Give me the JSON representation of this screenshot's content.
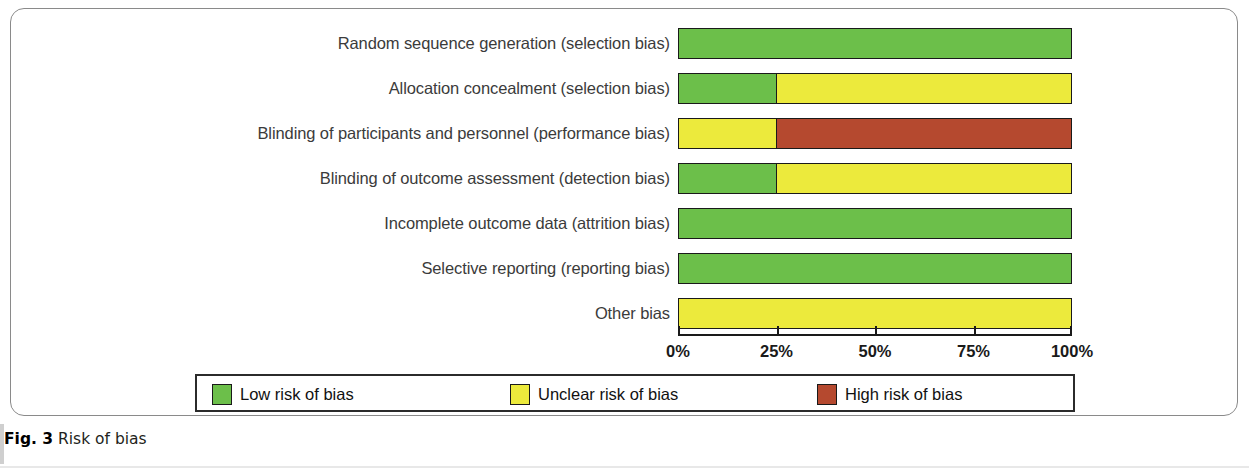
{
  "caption": {
    "prefix": "Fig. 3",
    "text": " Risk of bias"
  },
  "colors": {
    "low": "#6cbf4a",
    "unclear": "#ecea3c",
    "high": "#b5492f",
    "outline": "#1a1a1a",
    "frame": "#8a8a8a"
  },
  "legend": {
    "items": [
      {
        "label": "Low risk of bias",
        "color_key": "low",
        "left": 15
      },
      {
        "label": "Unclear risk of bias",
        "color_key": "unclear",
        "left": 313
      },
      {
        "label": "High risk of bias",
        "color_key": "high",
        "left": 620
      }
    ]
  },
  "axis": {
    "ticks": [
      {
        "label": "0%",
        "value": 0
      },
      {
        "label": "25%",
        "value": 25
      },
      {
        "label": "50%",
        "value": 50
      },
      {
        "label": "75%",
        "value": 75
      },
      {
        "label": "100%",
        "value": 100
      }
    ],
    "min": 0,
    "max": 100
  },
  "chart_data": {
    "type": "bar",
    "orientation": "horizontal",
    "stacked": true,
    "percent": true,
    "title": "Risk of bias",
    "xlabel": "",
    "ylabel": "",
    "xlim": [
      0,
      100
    ],
    "grid": false,
    "legend_position": "bottom",
    "tick_labels": [
      "0%",
      "25%",
      "50%",
      "75%",
      "100%"
    ],
    "categories": [
      "Random sequence generation (selection bias)",
      "Allocation concealment (selection bias)",
      "Blinding of participants and personnel (performance bias)",
      "Blinding of outcome assessment (detection bias)",
      "Incomplete outcome data (attrition bias)",
      "Selective reporting (reporting bias)",
      "Other bias"
    ],
    "series": [
      {
        "name": "Low risk of bias",
        "color": "#6cbf4a",
        "values": [
          100,
          25,
          0,
          25,
          100,
          100,
          0
        ]
      },
      {
        "name": "Unclear risk of bias",
        "color": "#ecea3c",
        "values": [
          0,
          75,
          25,
          75,
          0,
          0,
          100
        ]
      },
      {
        "name": "High risk of bias",
        "color": "#b5492f",
        "values": [
          0,
          0,
          75,
          0,
          0,
          0,
          0
        ]
      }
    ],
    "rows": [
      {
        "label": "Random sequence generation (selection bias)",
        "top": 28,
        "segments": [
          {
            "risk": "low",
            "pct": 100
          }
        ]
      },
      {
        "label": "Allocation concealment (selection bias)",
        "top": 73,
        "segments": [
          {
            "risk": "low",
            "pct": 25
          },
          {
            "risk": "unclear",
            "pct": 75
          }
        ]
      },
      {
        "label": "Blinding of participants and personnel (performance bias)",
        "top": 118,
        "segments": [
          {
            "risk": "unclear",
            "pct": 25
          },
          {
            "risk": "high",
            "pct": 75
          }
        ]
      },
      {
        "label": "Blinding of outcome assessment (detection bias)",
        "top": 163,
        "segments": [
          {
            "risk": "low",
            "pct": 25
          },
          {
            "risk": "unclear",
            "pct": 75
          }
        ]
      },
      {
        "label": "Incomplete outcome data (attrition bias)",
        "top": 208,
        "segments": [
          {
            "risk": "low",
            "pct": 100
          }
        ]
      },
      {
        "label": "Selective reporting (reporting bias)",
        "top": 253,
        "segments": [
          {
            "risk": "low",
            "pct": 100
          }
        ]
      },
      {
        "label": "Other bias",
        "top": 298,
        "segments": [
          {
            "risk": "unclear",
            "pct": 100
          }
        ]
      }
    ]
  }
}
